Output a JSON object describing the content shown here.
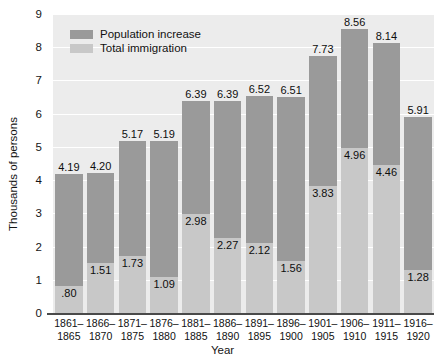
{
  "chart_data": {
    "type": "bar",
    "title": "",
    "xlabel": "Year",
    "ylabel": "Thousands of persons",
    "ylim": [
      0,
      9
    ],
    "yticks": [
      0,
      1,
      2,
      3,
      4,
      5,
      6,
      7,
      8,
      9
    ],
    "ytick_labels": [
      "0",
      "1",
      "2",
      "3",
      "4",
      "5",
      "6",
      "7",
      "8",
      "9"
    ],
    "grid": true,
    "grid_axis": "y",
    "legend_position": "upper-left-inside",
    "categories": [
      "1861–1865",
      "1866–1870",
      "1871–1875",
      "1876–1880",
      "1881–1885",
      "1886–1890",
      "1891–1895",
      "1896–1900",
      "1901–1905",
      "1906–1910",
      "1911–1915",
      "1916–1920"
    ],
    "category_lines": [
      [
        "1861–",
        "1865"
      ],
      [
        "1866–",
        "1870"
      ],
      [
        "1871–",
        "1875"
      ],
      [
        "1876–",
        "1880"
      ],
      [
        "1881–",
        "1885"
      ],
      [
        "1886–",
        "1890"
      ],
      [
        "1891–",
        "1895"
      ],
      [
        "1896–",
        "1900"
      ],
      [
        "1901–",
        "1905"
      ],
      [
        "1906–",
        "1910"
      ],
      [
        "1911–",
        "1915"
      ],
      [
        "1916–",
        "1920"
      ]
    ],
    "series": [
      {
        "name": "Population increase",
        "color": "#9a9a9a",
        "values": [
          4.19,
          4.2,
          5.17,
          5.19,
          6.39,
          6.39,
          6.52,
          6.51,
          7.73,
          8.56,
          8.14,
          5.91
        ],
        "labels": [
          "4.19",
          "4.20",
          "5.17",
          "5.19",
          "6.39",
          "6.39",
          "6.52",
          "6.51",
          "7.73",
          "8.56",
          "8.14",
          "5.91"
        ]
      },
      {
        "name": "Total immigration",
        "color": "#c8c8c8",
        "values": [
          0.8,
          1.51,
          1.73,
          1.09,
          2.98,
          2.27,
          2.12,
          1.56,
          3.83,
          4.96,
          4.46,
          1.28
        ],
        "labels": [
          ".80",
          "1.51",
          "1.73",
          "1.09",
          "2.98",
          "2.27",
          "2.12",
          "1.56",
          "3.83",
          "4.96",
          "4.46",
          "1.28"
        ]
      }
    ]
  },
  "legend": {
    "items": [
      {
        "label": "Population increase",
        "color": "#9a9a9a"
      },
      {
        "label": "Total immigration",
        "color": "#c8c8c8"
      }
    ]
  },
  "axes": {
    "y_title": "Thousands of persons",
    "x_title": "Year"
  },
  "colors": {
    "plot_background": "#ececec",
    "gridline": "#ffffff",
    "axis_line": "#4a4a4a",
    "dark_bar": "#9a9a9a",
    "light_bar": "#c8c8c8",
    "text": "#111111"
  }
}
